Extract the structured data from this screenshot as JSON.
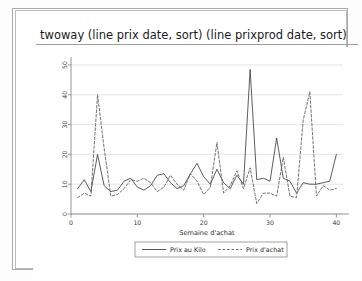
{
  "window": {
    "title": "twoway (line prix date, sort) (line prixprod date, sort)"
  },
  "chart_data": {
    "type": "line",
    "title": "twoway (line prix date, sort) (line prixprod date, sort)",
    "xlabel": "Semaine d'achat",
    "ylabel": "",
    "xlim": [
      0,
      41
    ],
    "ylim": [
      0,
      52
    ],
    "xticks": [
      0,
      10,
      20,
      30,
      40
    ],
    "xticklabels": [
      "0",
      "10",
      "20",
      "30",
      "40"
    ],
    "yticks": [
      0,
      10,
      20,
      30,
      40,
      50
    ],
    "yticklabels": [
      "0",
      "10",
      "20",
      "30",
      "40",
      "50"
    ],
    "grid": true,
    "grid_axis": "y",
    "legend_position": "bottom",
    "x": [
      1,
      2,
      3,
      4,
      5,
      6,
      7,
      8,
      9,
      10,
      11,
      12,
      13,
      14,
      15,
      16,
      17,
      18,
      19,
      20,
      21,
      22,
      23,
      24,
      25,
      26,
      27,
      28,
      29,
      30,
      31,
      32,
      33,
      34,
      35,
      36,
      37,
      38,
      39,
      40
    ],
    "series": [
      {
        "name": "Prix au Kilo",
        "style": "solid",
        "color": "#3f3f3f",
        "values": [
          8.5,
          11.5,
          7.5,
          20.0,
          9.5,
          7.5,
          8.0,
          11.0,
          12.0,
          9.0,
          8.0,
          9.5,
          13.0,
          13.5,
          10.5,
          8.5,
          9.5,
          13.5,
          17.0,
          12.5,
          10.0,
          15.0,
          10.5,
          8.5,
          13.0,
          10.0,
          48.5,
          11.5,
          12.0,
          11.0,
          25.5,
          12.0,
          11.0,
          7.0,
          10.5,
          10.0,
          10.0,
          10.5,
          11.0,
          20.0
        ]
      },
      {
        "name": "Prix d'achat",
        "style": "dashed",
        "color": "#5a5a5a",
        "values": [
          5.5,
          7.0,
          6.0,
          40.0,
          22.0,
          6.0,
          6.5,
          8.5,
          11.5,
          11.0,
          12.0,
          10.5,
          7.5,
          9.0,
          13.0,
          10.0,
          8.0,
          13.5,
          11.0,
          6.5,
          9.0,
          24.0,
          7.0,
          9.5,
          14.5,
          8.5,
          15.5,
          3.5,
          7.0,
          7.0,
          6.0,
          19.0,
          6.0,
          5.5,
          31.5,
          41.0,
          6.0,
          9.5,
          8.0,
          8.5
        ]
      }
    ],
    "legend": [
      {
        "label": "Prix au Kilo",
        "style": "solid"
      },
      {
        "label": "Prix d'achat",
        "style": "dashed"
      }
    ]
  }
}
